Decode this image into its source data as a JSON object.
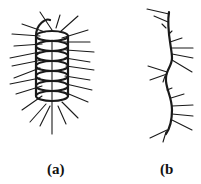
{
  "figure": {
    "panels": [
      {
        "id": "a",
        "label": "(a)",
        "description": "helical coil with radiating bristles"
      },
      {
        "id": "b",
        "label": "(b",
        "description": "wavy filament with side branches"
      }
    ],
    "colors": {
      "ink": "#1a1a1a",
      "background": "#ffffff"
    }
  }
}
